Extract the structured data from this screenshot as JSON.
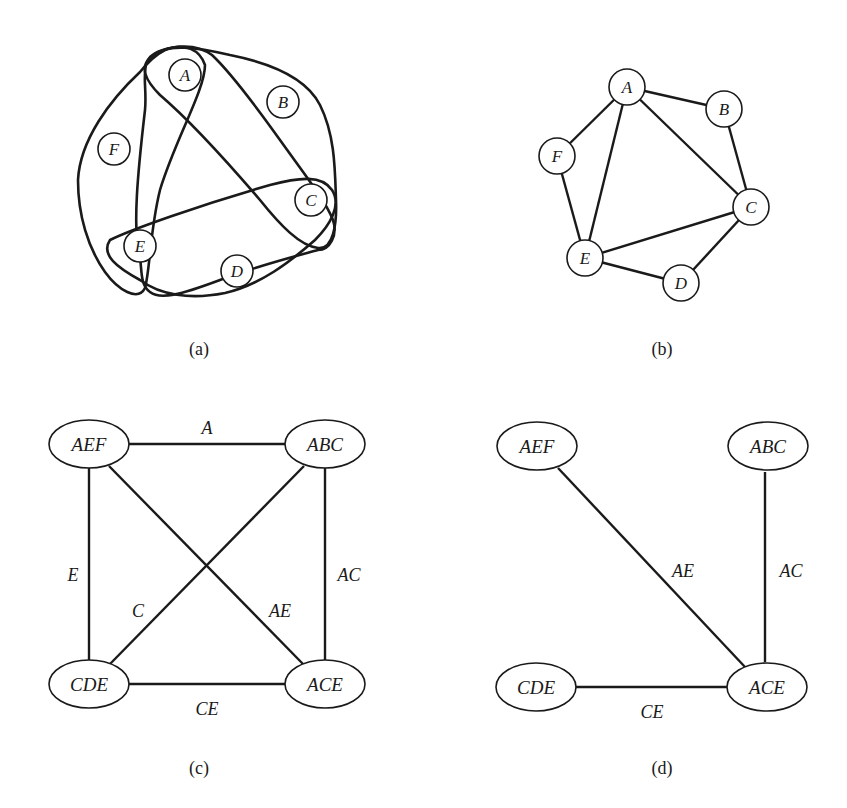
{
  "figure": {
    "panels": [
      {
        "id": "a",
        "caption": "(a)",
        "type": "hypergraph",
        "nodes": [
          "A",
          "B",
          "C",
          "D",
          "E",
          "F"
        ],
        "hyperedges": [
          [
            "A",
            "E",
            "F"
          ],
          [
            "A",
            "B",
            "C"
          ],
          [
            "C",
            "D",
            "E"
          ],
          [
            "A",
            "C",
            "E"
          ]
        ]
      },
      {
        "id": "b",
        "caption": "(b)",
        "type": "primal-graph",
        "nodes": [
          "A",
          "B",
          "C",
          "D",
          "E",
          "F"
        ],
        "edges": [
          [
            "A",
            "B"
          ],
          [
            "A",
            "F"
          ],
          [
            "A",
            "E"
          ],
          [
            "A",
            "C"
          ],
          [
            "B",
            "C"
          ],
          [
            "F",
            "E"
          ],
          [
            "E",
            "C"
          ],
          [
            "E",
            "D"
          ],
          [
            "D",
            "C"
          ]
        ]
      },
      {
        "id": "c",
        "caption": "(c)",
        "type": "dual-graph",
        "nodes": [
          "AEF",
          "ABC",
          "CDE",
          "ACE"
        ],
        "edges": [
          {
            "from": "AEF",
            "to": "ABC",
            "label": "A"
          },
          {
            "from": "AEF",
            "to": "CDE",
            "label": "E"
          },
          {
            "from": "ABC",
            "to": "ACE",
            "label": "AC"
          },
          {
            "from": "ABC",
            "to": "CDE",
            "label": "C"
          },
          {
            "from": "AEF",
            "to": "ACE",
            "label": "AE"
          },
          {
            "from": "CDE",
            "to": "ACE",
            "label": "CE"
          }
        ]
      },
      {
        "id": "d",
        "caption": "(d)",
        "type": "join-tree",
        "nodes": [
          "AEF",
          "ABC",
          "CDE",
          "ACE"
        ],
        "edges": [
          {
            "from": "AEF",
            "to": "ACE",
            "label": "AE"
          },
          {
            "from": "ABC",
            "to": "ACE",
            "label": "AC"
          },
          {
            "from": "CDE",
            "to": "ACE",
            "label": "CE"
          }
        ]
      }
    ]
  },
  "labels": {
    "a": {
      "A": "A",
      "B": "B",
      "C": "C",
      "D": "D",
      "E": "E",
      "F": "F",
      "caption": "(a)"
    },
    "b": {
      "A": "A",
      "B": "B",
      "C": "C",
      "D": "D",
      "E": "E",
      "F": "F",
      "caption": "(b)"
    },
    "c": {
      "AEF": "AEF",
      "ABC": "ABC",
      "CDE": "CDE",
      "ACE": "ACE",
      "e_A": "A",
      "e_E": "E",
      "e_AC": "AC",
      "e_C": "C",
      "e_AE": "AE",
      "e_CE": "CE",
      "caption": "(c)"
    },
    "d": {
      "AEF": "AEF",
      "ABC": "ABC",
      "CDE": "CDE",
      "ACE": "ACE",
      "e_AE": "AE",
      "e_AC": "AC",
      "e_CE": "CE",
      "caption": "(d)"
    }
  }
}
